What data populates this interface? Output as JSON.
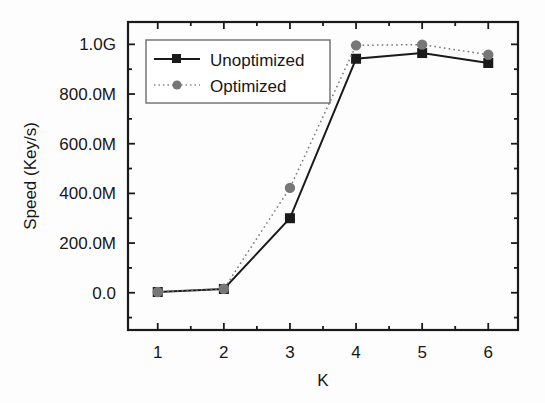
{
  "chart_data": {
    "type": "line",
    "title": "",
    "xlabel": "K",
    "ylabel": "Speed (Key/s)",
    "x": [
      1,
      2,
      3,
      4,
      5,
      6
    ],
    "xtick_labels": [
      "1",
      "2",
      "3",
      "4",
      "5",
      "6"
    ],
    "ytick_labels": [
      "0.0",
      "200.0M",
      "400.0M",
      "600.0M",
      "800.0M",
      "1.0G"
    ],
    "ytick_values": [
      0,
      200000000,
      400000000,
      600000000,
      800000000,
      1000000000
    ],
    "xlim": [
      0.55,
      6.45
    ],
    "ylim": [
      -150000000,
      1090000000
    ],
    "grid": false,
    "minor_ticks": true,
    "legend_position": "upper-left-inside",
    "series": [
      {
        "name": "Unoptimized",
        "values": [
          3000000,
          15000000,
          300000000,
          942000000,
          965000000,
          925000000
        ],
        "color": "#1a1a1a",
        "marker": "square",
        "linestyle": "solid"
      },
      {
        "name": "Optimized",
        "values": [
          3000000,
          16000000,
          422000000,
          996000000,
          999000000,
          958000000
        ],
        "color": "#777777",
        "marker": "circle",
        "linestyle": "dotted"
      }
    ]
  },
  "legend": {
    "entries": [
      {
        "label": "Unoptimized"
      },
      {
        "label": "Optimized"
      }
    ]
  },
  "axes": {
    "x_title": "K",
    "y_title": "Speed (Key/s)"
  }
}
